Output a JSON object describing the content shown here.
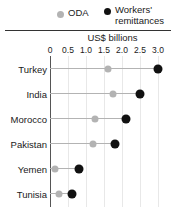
{
  "legend": {
    "items": [
      {
        "key": "oda",
        "label": "ODA",
        "color": "#b3b3b3",
        "marker": "circle-grey-icon"
      },
      {
        "key": "remittances",
        "label": "Workers'\nremittances",
        "color": "#111111",
        "marker": "circle-black-icon"
      }
    ]
  },
  "chart_data": {
    "type": "scatter",
    "subtype": "dumbbell",
    "title": "",
    "xlabel": "US$ billions",
    "ylabel": "",
    "xlim": [
      0,
      3.0
    ],
    "xticks": [
      0,
      0.5,
      1.0,
      1.5,
      2.0,
      2.5,
      3.0
    ],
    "xticklabels": [
      "0",
      "0.5",
      "1.0",
      "1.5",
      "2.0",
      "2.5",
      "3.0"
    ],
    "grid": true,
    "legend_position": "top",
    "categories": [
      "Turkey",
      "India",
      "Morocco",
      "Pakistan",
      "Yemen",
      "Tunisia"
    ],
    "series": [
      {
        "name": "ODA",
        "color": "#b3b3b3",
        "values": [
          1.6,
          1.75,
          1.25,
          1.2,
          0.15,
          0.25
        ]
      },
      {
        "name": "Workers' remittances",
        "color": "#111111",
        "values": [
          3.0,
          2.5,
          2.1,
          1.8,
          0.8,
          0.6
        ]
      }
    ]
  }
}
